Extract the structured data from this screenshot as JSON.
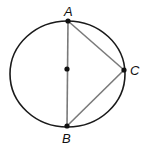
{
  "diagram": {
    "type": "geometry",
    "circle": {
      "cx": 67.5,
      "cy": 74,
      "r": 57,
      "stroke": "#1a1a1a"
    },
    "center_point": {
      "x": 67,
      "y": 69
    },
    "points": [
      {
        "id": "A",
        "label": "A",
        "x": 68,
        "y": 21,
        "label_x": 63,
        "label_y": 15
      },
      {
        "id": "B",
        "label": "B",
        "x": 67,
        "y": 126,
        "label_x": 62,
        "label_y": 142
      },
      {
        "id": "C",
        "label": "C",
        "x": 124,
        "y": 70,
        "label_x": 130,
        "label_y": 75
      }
    ],
    "segments": [
      {
        "from": "A",
        "to": "B",
        "color": "#7a7a7a"
      },
      {
        "from": "A",
        "to": "C",
        "color": "#7a7a7a"
      },
      {
        "from": "B",
        "to": "C",
        "color": "#7a7a7a"
      }
    ]
  }
}
